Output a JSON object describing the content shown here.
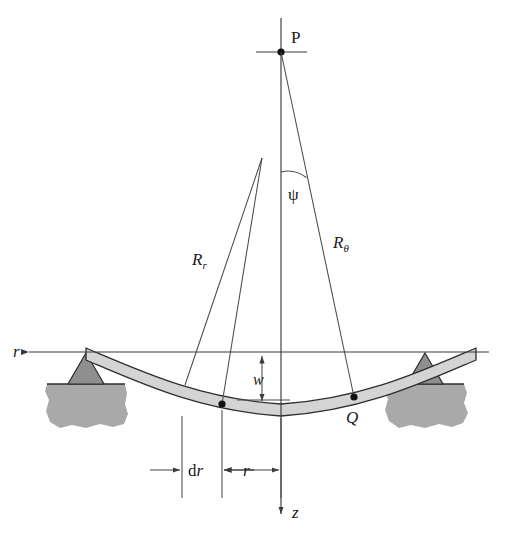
{
  "figure": {
    "type": "engineering-mechanics-diagram"
  },
  "colors": {
    "background": "#ffffff",
    "line": "#3a3a3a",
    "plate_fill": "#d4d4d4",
    "ground_fill": "#a9a9a9",
    "pivot_fill": "#8f8f8f",
    "text": "#1a1a1a"
  },
  "labels": {
    "point_p": "P",
    "point_q": "Q",
    "angle_psi": "ψ",
    "radius_r_base": "R",
    "radius_r_sub": "r",
    "radius_theta_base": "R",
    "radius_theta_sub": "θ",
    "deflection_w": "w",
    "axis_r": "r",
    "axis_z": "z",
    "dim_dr_d": "d",
    "dim_dr_r": "r",
    "dim_r": "r"
  },
  "geometry": {
    "center_x": 281,
    "point_p": {
      "x": 281,
      "y": 52
    },
    "point_q": {
      "x": 354,
      "y": 397
    },
    "point_dr": {
      "x": 222,
      "y": 404
    },
    "r_axis_y": 352,
    "z_axis_arrow_y": 512,
    "rr_apex": {
      "x": 262,
      "y": 158
    },
    "psi_arc_y": 172,
    "dim_line_x": [
      182,
      222,
      281
    ],
    "dim_row_y": 470,
    "w_arrow_x": 262,
    "w_top_y": 357,
    "w_bottom_y": 400
  },
  "annotations": {
    "description": "Cross-section of a circular plate deflecting under load, simply supported at both edges on pivot bearings resting on ground. Radii of curvature R-sub-r and R-sub-theta converge toward centre of curvature P on the z axis; the angle psi subtends between the z axis and the R-sub-theta ray.",
    "elements": [
      "point-p",
      "point-q",
      "radius-rr",
      "radius-rtheta",
      "angle-psi",
      "deflection-w",
      "r-axis",
      "z-axis",
      "dr-dimension",
      "r-dimension",
      "left-support",
      "right-support",
      "plate-band"
    ]
  }
}
